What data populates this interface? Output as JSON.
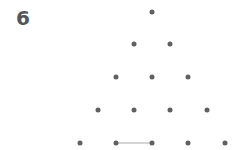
{
  "level": {
    "number": "6"
  },
  "colors": {
    "dot": "#606060",
    "edge": "#d4d4d4",
    "text": "#555555"
  },
  "dots": [
    {
      "row": 1,
      "x": 152,
      "y": 12
    },
    {
      "row": 2,
      "x": 134,
      "y": 44
    },
    {
      "row": 2,
      "x": 170,
      "y": 44
    },
    {
      "row": 3,
      "x": 116,
      "y": 77
    },
    {
      "row": 3,
      "x": 152,
      "y": 77
    },
    {
      "row": 3,
      "x": 188,
      "y": 77
    },
    {
      "row": 4,
      "x": 98,
      "y": 110
    },
    {
      "row": 4,
      "x": 134,
      "y": 110
    },
    {
      "row": 4,
      "x": 170,
      "y": 110
    },
    {
      "row": 4,
      "x": 207,
      "y": 110
    },
    {
      "row": 5,
      "x": 80,
      "y": 143
    },
    {
      "row": 5,
      "x": 116,
      "y": 143
    },
    {
      "row": 5,
      "x": 152,
      "y": 143
    },
    {
      "row": 5,
      "x": 188,
      "y": 143
    },
    {
      "row": 5,
      "x": 225,
      "y": 143
    }
  ],
  "edges": [
    {
      "from": [
        116,
        143
      ],
      "to": [
        152,
        143
      ]
    }
  ]
}
